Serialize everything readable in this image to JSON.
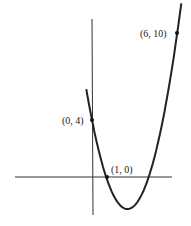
{
  "chart_data": {
    "type": "line",
    "title": "",
    "xlabel": "",
    "ylabel": "",
    "function": "y = x^2 - 5x + 4",
    "series": [
      {
        "name": "parabola",
        "x": [
          -0.35,
          0,
          1,
          2.5,
          4,
          6,
          6.3
        ],
        "y": [
          5.87,
          4,
          0,
          -2.25,
          0,
          10,
          12.19
        ]
      }
    ],
    "points": [
      {
        "label": "(0, 4)",
        "x": 0,
        "y": 4
      },
      {
        "label": "(1, 0)",
        "x": 1,
        "y": 0
      },
      {
        "label": "(6, 10)",
        "x": 6,
        "y": 10
      }
    ],
    "grid": false,
    "legend": null
  },
  "labels": {
    "p1": "(0, 4)",
    "p2": "(1, 0)",
    "p3": "(6, 10)"
  }
}
